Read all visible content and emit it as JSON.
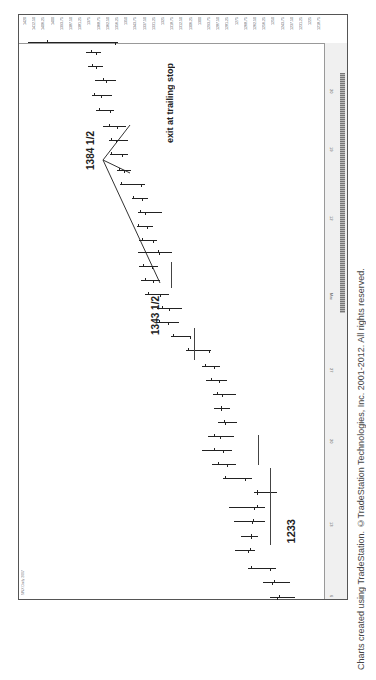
{
  "chart_data": {
    "type": "bar",
    "title": "$INX Daily 2007",
    "orientation": "rotated 90 degrees counter-clockwise (time runs bottom→top, price increases left)",
    "xlabel": "Date",
    "ylabel": "Price",
    "price_ticks": [
      "1420",
      "1412.50",
      "1406.25",
      "1400",
      "1393.75",
      "1387.50",
      "1381.25",
      "1375",
      "1368.75",
      "1362.50",
      "1356.25",
      "1350",
      "1343.75",
      "1337.50",
      "1331.25",
      "1325",
      "1318.75",
      "1312.50",
      "1306.25",
      "1300",
      "1293.75",
      "1287.50",
      "1281.25",
      "1275",
      "1268.75",
      "1262.50",
      "1256.25",
      "1250",
      "1243.75",
      "1237.50",
      "1231.25",
      "1225",
      "1218.75"
    ],
    "date_ticks": [
      {
        "label": "6",
        "y": 594
      },
      {
        "label": "13",
        "y": 521
      },
      {
        "label": "20",
        "y": 438
      },
      {
        "label": "27",
        "y": 367
      },
      {
        "label": "Mar",
        "y": 292
      },
      {
        "label": "12",
        "y": 215
      },
      {
        "label": "19",
        "y": 146
      },
      {
        "label": "20",
        "y": 88
      }
    ],
    "annotations": [
      {
        "text": "1233",
        "x": 285,
        "y": 532,
        "size": 11
      },
      {
        "text": "1343 1/2",
        "x": 150,
        "y": 320,
        "size": 10
      },
      {
        "text": "1384 1/2",
        "x": 85,
        "y": 155,
        "size": 10
      },
      {
        "text": "exit at trailing stop",
        "x": 165,
        "y": 120,
        "size": 9
      }
    ],
    "bars": [
      {
        "y": 597,
        "low": 270,
        "high": 295,
        "open": 279,
        "close": 277
      },
      {
        "y": 582,
        "low": 263,
        "high": 290,
        "open": 274,
        "close": 272
      },
      {
        "y": 568,
        "low": 248,
        "high": 276,
        "open": 251,
        "close": 270
      },
      {
        "y": 550,
        "low": 235,
        "high": 255,
        "open": 250,
        "close": 248
      },
      {
        "y": 536,
        "low": 241,
        "high": 258,
        "open": 251,
        "close": 251
      },
      {
        "y": 521,
        "low": 234,
        "high": 265,
        "open": 253,
        "close": 252
      },
      {
        "y": 507,
        "low": 229,
        "high": 265,
        "open": 257,
        "close": 254
      },
      {
        "y": 492,
        "low": 254,
        "high": 277,
        "open": 257,
        "close": 257
      },
      {
        "y": 478,
        "low": 223,
        "high": 252,
        "open": 225,
        "close": 245
      },
      {
        "y": 464,
        "low": 212,
        "high": 236,
        "open": 218,
        "close": 227
      },
      {
        "y": 450,
        "low": 202,
        "high": 232,
        "open": 214,
        "close": 223
      },
      {
        "y": 436,
        "low": 208,
        "high": 234,
        "open": 214,
        "close": 220
      },
      {
        "y": 422,
        "low": 218,
        "high": 237,
        "open": 224,
        "close": 225
      },
      {
        "y": 408,
        "low": 214,
        "high": 230,
        "open": 221,
        "close": 221
      },
      {
        "y": 394,
        "low": 213,
        "high": 236,
        "open": 217,
        "close": 222
      },
      {
        "y": 380,
        "low": 206,
        "high": 227,
        "open": 211,
        "close": 219
      },
      {
        "y": 366,
        "low": 202,
        "high": 220,
        "open": 205,
        "close": 214
      },
      {
        "y": 350,
        "low": 186,
        "high": 211,
        "open": 188,
        "close": 209
      },
      {
        "y": 336,
        "low": 171,
        "high": 191,
        "open": 173,
        "close": 190
      },
      {
        "y": 322,
        "low": 156,
        "high": 179,
        "open": 159,
        "close": 168
      },
      {
        "y": 308,
        "low": 157,
        "high": 182,
        "open": 162,
        "close": 169
      },
      {
        "y": 294,
        "low": 145,
        "high": 169,
        "open": 148,
        "close": 160
      },
      {
        "y": 280,
        "low": 141,
        "high": 160,
        "open": 145,
        "close": 153
      },
      {
        "y": 266,
        "low": 139,
        "high": 158,
        "open": 143,
        "close": 152
      },
      {
        "y": 252,
        "low": 138,
        "high": 172,
        "open": 158,
        "close": 159
      },
      {
        "y": 240,
        "low": 139,
        "high": 157,
        "open": 142,
        "close": 153
      },
      {
        "y": 226,
        "low": 137,
        "high": 153,
        "open": 138,
        "close": 147
      },
      {
        "y": 212,
        "low": 138,
        "high": 162,
        "open": 140,
        "close": 145
      },
      {
        "y": 198,
        "low": 132,
        "high": 148,
        "open": 133,
        "close": 142
      },
      {
        "y": 184,
        "low": 120,
        "high": 145,
        "open": 121,
        "close": 141
      },
      {
        "y": 170,
        "low": 117,
        "high": 131,
        "open": 119,
        "close": 124
      },
      {
        "y": 154,
        "low": 110,
        "high": 128,
        "open": 111,
        "close": 122
      },
      {
        "y": 140,
        "low": 109,
        "high": 128,
        "open": 111,
        "close": 116
      },
      {
        "y": 126,
        "low": 103,
        "high": 126,
        "open": 109,
        "close": 117
      },
      {
        "y": 110,
        "low": 96,
        "high": 114,
        "open": 99,
        "close": 110
      },
      {
        "y": 95,
        "low": 92,
        "high": 112,
        "open": 94,
        "close": 101
      },
      {
        "y": 80,
        "low": 95,
        "high": 116,
        "open": 103,
        "close": 106
      },
      {
        "y": 66,
        "low": 88,
        "high": 103,
        "open": 92,
        "close": 96
      },
      {
        "y": 52,
        "low": 86,
        "high": 101,
        "open": 91,
        "close": 96
      },
      {
        "y": 42,
        "low": 28,
        "high": 118,
        "open": 47,
        "close": 115
      }
    ],
    "reference_lines": [
      {
        "x": 270,
        "y1": 468,
        "y2": 545
      },
      {
        "x": 258,
        "y1": 435,
        "y2": 465
      },
      {
        "x": 194,
        "y1": 328,
        "y2": 360
      },
      {
        "x": 171,
        "y1": 262,
        "y2": 288
      }
    ],
    "trend_lines": [
      {
        "x1": 160,
        "y1": 283,
        "x2": 103,
        "y2": 160
      },
      {
        "x1": 103,
        "y1": 160,
        "x2": 130,
        "y2": 125
      },
      {
        "x1": 103,
        "y1": 160,
        "x2": 130,
        "y2": 173
      }
    ]
  },
  "header": {
    "text": "$INX Daily 2007 ..."
  },
  "credit": "Charts created using TradeStation. ©TradeStation Technologies, Inc. 2001-2012. All rights reserved."
}
